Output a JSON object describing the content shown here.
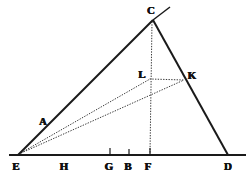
{
  "figure": {
    "background_color": "#ffffff",
    "ink_color": "#1a1a1a",
    "dotted_color": "#3a3a3a",
    "width": 251,
    "height": 180,
    "points": [
      {
        "id": "C",
        "label": "C",
        "x": 153,
        "y": 20,
        "label_x": 151,
        "label_y": 10,
        "role": "apex-vertex"
      },
      {
        "id": "K",
        "label": "K",
        "x": 184,
        "y": 80,
        "label_x": 192,
        "label_y": 75,
        "role": "point-on-side-CD"
      },
      {
        "id": "L",
        "label": "L",
        "x": 150,
        "y": 79,
        "label_x": 142,
        "label_y": 74,
        "role": "interior-point"
      },
      {
        "id": "A",
        "label": "A",
        "x": 48,
        "y": 128,
        "label_x": 43,
        "label_y": 122,
        "role": "point-on-side-EC"
      },
      {
        "id": "E",
        "label": "E",
        "x": 18,
        "y": 155,
        "label_x": 16,
        "label_y": 166,
        "role": "left-base-vertex"
      },
      {
        "id": "H",
        "label": "H",
        "x": 66,
        "y": 155,
        "label_x": 64,
        "label_y": 166,
        "role": "base-point"
      },
      {
        "id": "G",
        "label": "G",
        "x": 110,
        "y": 155,
        "label_x": 109,
        "label_y": 166,
        "role": "base-point"
      },
      {
        "id": "B",
        "label": "B",
        "x": 129,
        "y": 155,
        "label_x": 128,
        "label_y": 166,
        "role": "base-point"
      },
      {
        "id": "F",
        "label": "F",
        "x": 150,
        "y": 155,
        "label_x": 148,
        "label_y": 166,
        "role": "base-point-foot-of-perpendicular"
      },
      {
        "id": "D",
        "label": "D",
        "x": 228,
        "y": 155,
        "label_x": 228,
        "label_y": 166,
        "role": "right-base-vertex"
      }
    ],
    "solid_segments": [
      {
        "name": "side-EC",
        "x1": 18,
        "y1": 155,
        "x2": 153,
        "y2": 20,
        "width": 2.0
      },
      {
        "name": "extension-beyond-C",
        "x1": 153,
        "y1": 20,
        "x2": 170,
        "y2": 7,
        "width": 1.5
      },
      {
        "name": "side-CD",
        "x1": 153,
        "y1": 20,
        "x2": 228,
        "y2": 155,
        "width": 2.0
      },
      {
        "name": "base-ED",
        "x1": 9,
        "y1": 155,
        "x2": 246,
        "y2": 155,
        "width": 2.1
      }
    ],
    "dotted_segments": [
      {
        "name": "segment-E-L",
        "x1": 19,
        "y1": 154,
        "x2": 150,
        "y2": 79
      },
      {
        "name": "segment-E-K",
        "x1": 19,
        "y1": 154,
        "x2": 184,
        "y2": 80
      },
      {
        "name": "segment-L-K",
        "x1": 150,
        "y1": 79,
        "x2": 184,
        "y2": 80
      },
      {
        "name": "perpendicular-C-F",
        "x1": 152,
        "y1": 22,
        "x2": 150,
        "y2": 154
      }
    ],
    "tick_marks": [
      {
        "name": "tick-G",
        "x": 110,
        "y_top": 148,
        "y_bottom": 156
      },
      {
        "name": "tick-B",
        "x": 129,
        "y_top": 149,
        "y_bottom": 156
      },
      {
        "name": "tick-F",
        "x": 150,
        "y_top": 148,
        "y_bottom": 156
      }
    ]
  }
}
